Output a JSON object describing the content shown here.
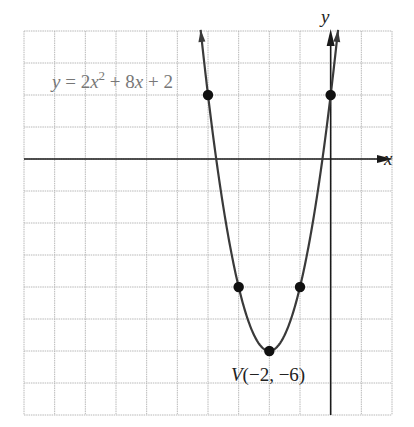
{
  "chart_data": {
    "type": "line",
    "title": "",
    "equation_label": "y = 2x² + 8x + 2",
    "equation_parts": {
      "lhs": "y",
      "eq": " = 2",
      "x1": "x",
      "sup": "2",
      "mid": " + 8",
      "x2": "x",
      "end": " + 2"
    },
    "xlabel": "x",
    "ylabel": "y",
    "xlim": [
      -10,
      2
    ],
    "ylim": [
      -8,
      4
    ],
    "grid": true,
    "function": {
      "a": 2,
      "b": 8,
      "c": 2
    },
    "curve_x_range": [
      -4.24,
      0.24
    ],
    "points": [
      {
        "x": -4,
        "y": 2
      },
      {
        "x": -3,
        "y": -4
      },
      {
        "x": -2,
        "y": -6
      },
      {
        "x": -1,
        "y": -4
      },
      {
        "x": 0,
        "y": 2
      }
    ],
    "vertex": {
      "x": -2,
      "y": -6,
      "label": "V(−2, −6)"
    }
  },
  "colors": {
    "grid": "#b8b8b8",
    "axis": "#1a1a1a",
    "curve": "#3a3a3a",
    "point": "#111111",
    "equation_text": "#777777",
    "label_text": "#222222"
  }
}
